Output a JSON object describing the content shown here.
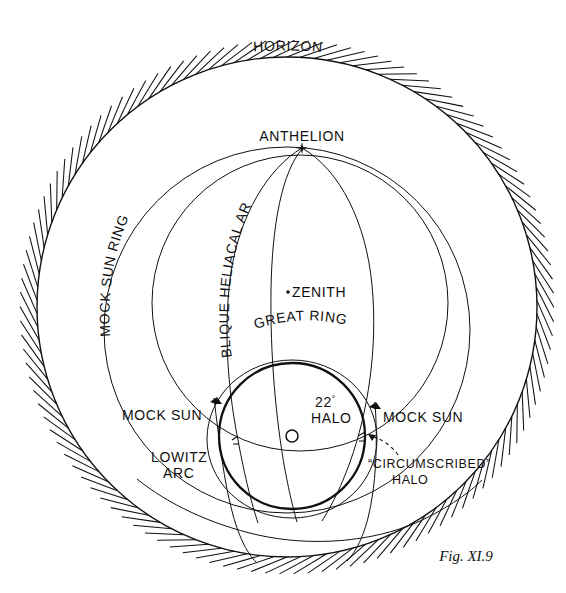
{
  "figure": {
    "caption": "Fig. XI.9",
    "width": 566,
    "height": 593,
    "background_color": "#ffffff",
    "ink_color": "#111111"
  },
  "labels": {
    "horizon": "HORIZON",
    "anthelion": "ANTHELION",
    "mock_sun_ring": "MOCK  SUN RING",
    "oblique_heliacal_arc": "OBLIQUE HELIACAL ARC",
    "zenith": "ZENITH",
    "great_ring": "GREAT  RING",
    "mock_sun_left": "MOCK SUN",
    "mock_sun_right": "MOCK SUN",
    "lowitz_arc_line1": "LOWITZ",
    "lowitz_arc_line2": "ARC",
    "halo_22_line1": "22",
    "halo_22_degree": "°",
    "halo_22_line2": "HALO",
    "circumscribed_halo_line1": "“CIRCUMSCRIBED”",
    "circumscribed_halo_line2": "HALO"
  },
  "geometry": {
    "horizon_circle": {
      "cx": 287,
      "cy": 307,
      "r": 250,
      "hatch_count": 118,
      "hatch_length": 17
    },
    "mock_sun_ring": {
      "cx": 287,
      "cy": 330,
      "rx": 183,
      "ry": 183
    },
    "great_ring": {
      "cx": 300,
      "cy": 300,
      "rx": 150,
      "ry": 150
    },
    "oblique_heliacal_arc": {
      "top_x": 302,
      "top_y": 148,
      "bottom_x": 245,
      "bottom_y": 520
    },
    "zenith_meridian": {
      "top_x": 302,
      "top_y": 148,
      "bottom_x": 300,
      "bottom_y": 500
    },
    "halo_22": {
      "cx": 292,
      "cy": 436,
      "r": 73
    },
    "circumscribed_halo": {
      "cx": 292,
      "cy": 438,
      "rx": 84,
      "ry": 78
    },
    "sun": {
      "cx": 292,
      "cy": 436,
      "r": 6
    },
    "anthelion_point": {
      "x": 302,
      "y": 148
    },
    "zenith_point": {
      "x": 284,
      "y": 292
    },
    "mock_sun_left_point": {
      "x": 215,
      "y": 400
    },
    "mock_sun_right_point": {
      "x": 374,
      "y": 404
    }
  },
  "chart_data": {
    "type": "diagram",
    "elements": [
      {
        "name": "HORIZON",
        "kind": "hatched-circle",
        "note": "outermost boundary, hatching on outside"
      },
      {
        "name": "MOCK SUN RING",
        "kind": "great-circle",
        "note": "parhelic circle passing through sun and anthelion"
      },
      {
        "name": "OBLIQUE HELIACAL ARC",
        "kind": "arc",
        "note": "runs from anthelion down past left of zenith"
      },
      {
        "name": "ZENITH",
        "kind": "point",
        "note": "marked with a dot near centre"
      },
      {
        "name": "ANTHELION",
        "kind": "point",
        "note": "marked with a star at top of great ring"
      },
      {
        "name": "GREAT RING",
        "kind": "great-circle",
        "note": "large ring crossing the mock sun ring"
      },
      {
        "name": "22° HALO",
        "kind": "circle",
        "note": "bold circle of 22 degree radius centred on sun"
      },
      {
        "name": "“CIRCUMSCRIBED” HALO",
        "kind": "oval",
        "note": "oval slightly outside the 22° halo, dashed leader arrow"
      },
      {
        "name": "MOCK SUN",
        "kind": "point",
        "count": 2,
        "note": "parhelia left and right of the sun on the mock sun ring"
      },
      {
        "name": "LOWITZ ARC",
        "kind": "arc",
        "note": "arcs descending from the mock suns"
      },
      {
        "name": "SUN",
        "kind": "point",
        "note": "open circle at centre of 22° halo"
      }
    ]
  }
}
